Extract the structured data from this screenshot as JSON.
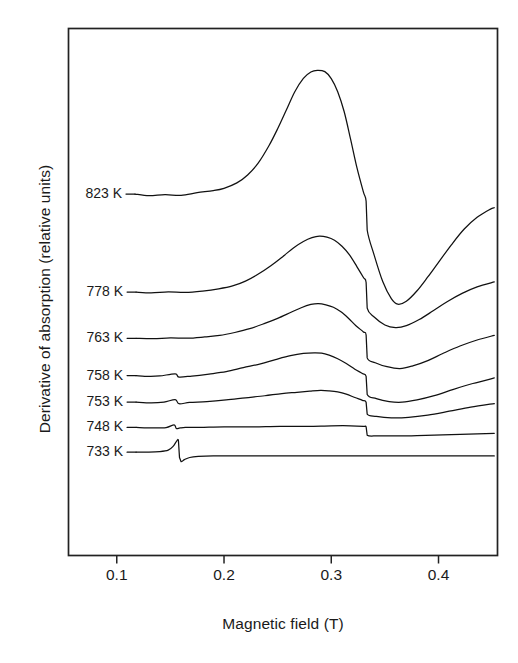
{
  "chart_data": {
    "type": "line",
    "title": "",
    "xlabel": "Magnetic field (T)",
    "ylabel": "Derivative of absorption (relative units)",
    "xlim": [
      0.055,
      0.455
    ],
    "ylim": [
      0,
      1
    ],
    "grid": false,
    "legend_position": "inline-left-labels",
    "xticks": [
      0.1,
      0.2,
      0.3,
      0.4
    ],
    "xtick_labels": [
      "0.1",
      "0.2",
      "0.3",
      "0.4"
    ],
    "yticks": [],
    "ytick_labels": [],
    "series": [
      {
        "name": "823 K",
        "label": "823 K",
        "color": "#111111",
        "baseline_y": 0.686,
        "peak_x": 0.287,
        "trough_x": 0.362,
        "x": [
          0.117,
          0.13,
          0.145,
          0.16,
          0.175,
          0.19,
          0.2,
          0.212,
          0.222,
          0.232,
          0.242,
          0.25,
          0.258,
          0.266,
          0.274,
          0.281,
          0.287,
          0.294,
          0.3,
          0.306,
          0.312,
          0.318,
          0.324,
          0.33,
          0.3325,
          0.3335,
          0.34,
          0.348,
          0.356,
          0.362,
          0.37,
          0.38,
          0.39,
          0.4,
          0.412,
          0.424,
          0.436,
          0.448,
          0.452
        ],
        "y": [
          0.686,
          0.683,
          0.685,
          0.684,
          0.688,
          0.692,
          0.697,
          0.707,
          0.722,
          0.745,
          0.778,
          0.81,
          0.845,
          0.88,
          0.905,
          0.917,
          0.921,
          0.918,
          0.905,
          0.88,
          0.842,
          0.79,
          0.735,
          0.69,
          0.672,
          0.618,
          0.57,
          0.52,
          0.487,
          0.477,
          0.482,
          0.502,
          0.528,
          0.556,
          0.59,
          0.62,
          0.642,
          0.657,
          0.66
        ]
      },
      {
        "name": "778 K",
        "label": "778 K",
        "color": "#111111",
        "baseline_y": 0.5,
        "peak_x": 0.287,
        "trough_x": 0.36,
        "x": [
          0.118,
          0.132,
          0.148,
          0.164,
          0.18,
          0.195,
          0.208,
          0.22,
          0.232,
          0.244,
          0.255,
          0.265,
          0.274,
          0.282,
          0.289,
          0.296,
          0.303,
          0.31,
          0.317,
          0.324,
          0.33,
          0.3325,
          0.3335,
          0.34,
          0.35,
          0.36,
          0.37,
          0.382,
          0.395,
          0.408,
          0.422,
          0.436,
          0.452
        ],
        "y": [
          0.5,
          0.498,
          0.5,
          0.499,
          0.502,
          0.506,
          0.512,
          0.521,
          0.534,
          0.55,
          0.568,
          0.584,
          0.596,
          0.603,
          0.606,
          0.604,
          0.598,
          0.587,
          0.57,
          0.548,
          0.528,
          0.518,
          0.47,
          0.452,
          0.437,
          0.432,
          0.436,
          0.448,
          0.464,
          0.481,
          0.497,
          0.51,
          0.519
        ]
      },
      {
        "name": "763 K",
        "label": "763 K",
        "color": "#111111",
        "baseline_y": 0.412,
        "peak_x": 0.288,
        "trough_x": 0.36,
        "x": [
          0.118,
          0.134,
          0.15,
          0.166,
          0.182,
          0.196,
          0.21,
          0.224,
          0.238,
          0.25,
          0.262,
          0.272,
          0.281,
          0.288,
          0.295,
          0.302,
          0.309,
          0.316,
          0.323,
          0.33,
          0.3325,
          0.3335,
          0.341,
          0.352,
          0.364,
          0.376,
          0.39,
          0.404,
          0.42,
          0.436,
          0.452
        ],
        "y": [
          0.412,
          0.411,
          0.413,
          0.412,
          0.415,
          0.418,
          0.423,
          0.43,
          0.44,
          0.45,
          0.461,
          0.47,
          0.476,
          0.478,
          0.476,
          0.471,
          0.462,
          0.45,
          0.436,
          0.424,
          0.418,
          0.375,
          0.366,
          0.358,
          0.355,
          0.36,
          0.37,
          0.383,
          0.397,
          0.409,
          0.418
        ]
      },
      {
        "name": "758 K",
        "label": "758 K",
        "color": "#111111",
        "baseline_y": 0.341,
        "peak_x": 0.29,
        "trough_x": 0.362,
        "x": [
          0.118,
          0.13,
          0.14,
          0.1545,
          0.158,
          0.17,
          0.186,
          0.202,
          0.218,
          0.234,
          0.248,
          0.262,
          0.274,
          0.284,
          0.291,
          0.298,
          0.306,
          0.314,
          0.322,
          0.329,
          0.3325,
          0.3335,
          0.342,
          0.354,
          0.366,
          0.38,
          0.396,
          0.414,
          0.432,
          0.452
        ],
        "y": [
          0.341,
          0.34,
          0.341,
          0.345,
          0.339,
          0.341,
          0.344,
          0.349,
          0.356,
          0.364,
          0.372,
          0.379,
          0.383,
          0.385,
          0.384,
          0.38,
          0.373,
          0.364,
          0.353,
          0.345,
          0.34,
          0.305,
          0.298,
          0.292,
          0.291,
          0.295,
          0.303,
          0.315,
          0.326,
          0.337
        ]
      },
      {
        "name": "753 K",
        "label": "753 K",
        "color": "#111111",
        "baseline_y": 0.291,
        "peak_x": 0.296,
        "trough_x": 0.362,
        "x": [
          0.118,
          0.132,
          0.144,
          0.1545,
          0.158,
          0.168,
          0.184,
          0.202,
          0.22,
          0.238,
          0.254,
          0.268,
          0.28,
          0.29,
          0.298,
          0.306,
          0.314,
          0.322,
          0.329,
          0.3325,
          0.3335,
          0.342,
          0.356,
          0.372,
          0.39,
          0.41,
          0.43,
          0.452
        ],
        "y": [
          0.291,
          0.29,
          0.291,
          0.296,
          0.288,
          0.29,
          0.292,
          0.295,
          0.299,
          0.303,
          0.307,
          0.31,
          0.312,
          0.313,
          0.312,
          0.31,
          0.306,
          0.3,
          0.294,
          0.291,
          0.268,
          0.264,
          0.261,
          0.262,
          0.267,
          0.274,
          0.281,
          0.288
        ]
      },
      {
        "name": "748 K",
        "label": "748 K",
        "color": "#111111",
        "baseline_y": 0.243,
        "peak_x": 0.155,
        "trough_x": 0.335,
        "x": [
          0.118,
          0.134,
          0.146,
          0.1535,
          0.1555,
          0.159,
          0.164,
          0.178,
          0.2,
          0.226,
          0.252,
          0.278,
          0.3,
          0.318,
          0.33,
          0.3325,
          0.3335,
          0.344,
          0.364,
          0.388,
          0.412,
          0.436,
          0.452
        ],
        "y": [
          0.243,
          0.242,
          0.243,
          0.248,
          0.241,
          0.242,
          0.243,
          0.243,
          0.244,
          0.244,
          0.245,
          0.245,
          0.246,
          0.246,
          0.245,
          0.244,
          0.228,
          0.227,
          0.227,
          0.228,
          0.229,
          0.231,
          0.232
        ]
      },
      {
        "name": "733 K",
        "label": "733 K",
        "color": "#111111",
        "baseline_y": 0.196,
        "peak_x": 0.156,
        "trough_x": 0.16,
        "x": [
          0.118,
          0.13,
          0.14,
          0.148,
          0.1525,
          0.1555,
          0.1575,
          0.1585,
          0.16,
          0.163,
          0.168,
          0.176,
          0.19,
          0.214,
          0.244,
          0.278,
          0.312,
          0.346,
          0.38,
          0.414,
          0.452
        ],
        "y": [
          0.196,
          0.196,
          0.197,
          0.2,
          0.207,
          0.216,
          0.218,
          0.186,
          0.178,
          0.182,
          0.186,
          0.188,
          0.189,
          0.189,
          0.189,
          0.189,
          0.189,
          0.189,
          0.189,
          0.189,
          0.189
        ]
      }
    ],
    "label_anchor_x": 0.117,
    "axis_color": "#222222",
    "background_color": "#ffffff"
  }
}
